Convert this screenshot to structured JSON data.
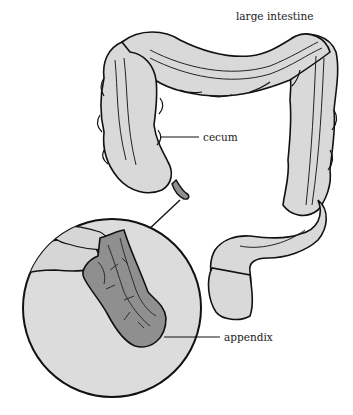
{
  "diagram": {
    "labels": {
      "large_intestine": "large intestine",
      "cecum": "cecum",
      "appendix": "appendix"
    },
    "colors": {
      "background": "#ffffff",
      "intestine_fill": "#d9d9d9",
      "appendix_fill": "#8f8f8f",
      "outline": "#111111",
      "magnifier_fill": "#dcdcdc"
    }
  }
}
